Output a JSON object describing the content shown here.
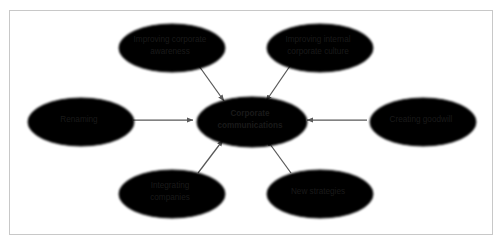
{
  "figure": {
    "caption_fragment": "",
    "frame_color": "#c8c8c8",
    "background_color": "#ffffff"
  },
  "diagram": {
    "type": "hub-and-spoke concept map",
    "node_fill": "#e3e3e3",
    "node_stroke": "#6e6e6e",
    "arrow_color": "#595959",
    "hub": {
      "id": "corporate-communications",
      "line1": "Corporate",
      "line2": "communications",
      "bold": true,
      "cx": 250,
      "cy": 120,
      "rx": 55,
      "ry": 25
    },
    "nodes": [
      {
        "id": "improving-corporate-awareness",
        "line1": "Improving corporate",
        "line2": "awareness",
        "cx": 170,
        "cy": 46,
        "rx": 53,
        "ry": 24
      },
      {
        "id": "improving-internal-corporate-culture",
        "line1": "Improving internal",
        "line2": "corporate culture",
        "cx": 318,
        "cy": 46,
        "rx": 53,
        "ry": 24
      },
      {
        "id": "renaming",
        "line1": "Renaming",
        "line2": "",
        "cx": 79,
        "cy": 120,
        "rx": 53,
        "ry": 24
      },
      {
        "id": "creating-goodwill",
        "line1": "Creating goodwill",
        "line2": "",
        "cx": 421,
        "cy": 120,
        "rx": 53,
        "ry": 24
      },
      {
        "id": "integrating-companies",
        "line1": "Integrating",
        "line2": "companies",
        "cx": 170,
        "cy": 192,
        "rx": 53,
        "ry": 24
      },
      {
        "id": "new-strategies",
        "line1": "New strategies",
        "line2": "",
        "cx": 318,
        "cy": 192,
        "rx": 53,
        "ry": 24
      }
    ],
    "arrows": [
      {
        "id": "arrow-awareness-to-hub",
        "from": "improving-corporate-awareness",
        "to": "corporate-communications",
        "x1": 199,
        "y1": 66,
        "x2": 224,
        "y2": 101
      },
      {
        "id": "arrow-culture-to-hub",
        "from": "improving-internal-corporate-culture",
        "to": "corporate-communications",
        "x1": 290,
        "y1": 66,
        "x2": 266,
        "y2": 101
      },
      {
        "id": "arrow-renaming-to-hub",
        "from": "renaming",
        "to": "corporate-communications",
        "x1": 133,
        "y1": 120,
        "x2": 193,
        "y2": 120
      },
      {
        "id": "arrow-goodwill-to-hub",
        "from": "creating-goodwill",
        "to": "corporate-communications",
        "x1": 367,
        "y1": 120,
        "x2": 307,
        "y2": 120
      },
      {
        "id": "arrow-integrating-to-hub",
        "from": "integrating-companies",
        "to": "corporate-communications",
        "x1": 198,
        "y1": 173,
        "x2": 223,
        "y2": 140
      },
      {
        "id": "arrow-strategies-to-hub",
        "from": "new-strategies",
        "to": "corporate-communications",
        "x1": 291,
        "y1": 173,
        "x2": 267,
        "y2": 140
      }
    ]
  }
}
